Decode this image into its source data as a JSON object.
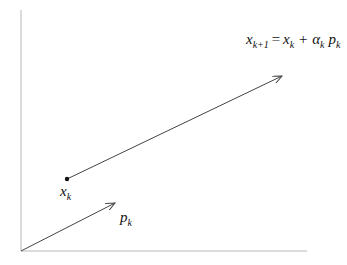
{
  "diagram": {
    "colors": {
      "axis": "#b8b8b8",
      "arrow": "#444444",
      "text": "#111111"
    },
    "axes": {
      "origin": [
        21,
        251
      ],
      "y_top": [
        21,
        10
      ],
      "x_right": [
        307,
        251
      ]
    },
    "nodes": [
      {
        "id": "xk",
        "label_base": "x",
        "label_sub": "k",
        "pos": [
          67,
          179
        ]
      }
    ],
    "edges": [
      {
        "id": "step",
        "from": [
          67,
          179
        ],
        "to": [
          282,
          76
        ],
        "label": "x_{k+1} = x_k + α_k p_k"
      },
      {
        "id": "direction",
        "from": [
          21,
          251
        ],
        "to": [
          115,
          203
        ],
        "label": "p_k"
      }
    ],
    "labels": {
      "update": {
        "x1": "x",
        "sub1": "k+1",
        "eq": "=",
        "x2": "x",
        "sub2": "k",
        "plus": "+",
        "alpha": "α",
        "sub3": "k",
        "p": "p",
        "sub4": "k"
      },
      "xk": {
        "base": "x",
        "sub": "k"
      },
      "pk": {
        "base": "p",
        "sub": "k"
      }
    }
  }
}
